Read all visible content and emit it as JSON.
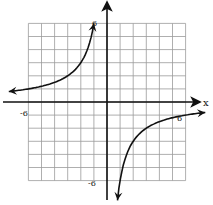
{
  "chart_data": {
    "type": "line",
    "title": "",
    "function": "y = -6/x",
    "xlabel": "x",
    "ylabel": "",
    "xlim": [
      -6,
      6
    ],
    "ylim": [
      -6,
      6
    ],
    "grid": true,
    "grid_step": 1,
    "tick_labels": {
      "x_neg": "-6",
      "x_pos": "6",
      "y_pos": "6",
      "y_neg": "-6"
    },
    "series": [
      {
        "name": "left branch",
        "x": [
          -7.5,
          -6,
          -5,
          -4,
          -3,
          -2,
          -1.5,
          -1.2,
          -1
        ],
        "y": [
          0.8,
          1,
          1.2,
          1.5,
          2,
          3,
          4,
          5,
          6
        ]
      },
      {
        "name": "right branch",
        "x": [
          0.8,
          1,
          1.2,
          1.5,
          2,
          3,
          4,
          5,
          6,
          7.5
        ],
        "y": [
          -7.5,
          -6,
          -5,
          -4,
          -3,
          -2,
          -1.5,
          -1.2,
          -1,
          -0.8
        ]
      }
    ],
    "asymptotes": {
      "vertical": 0,
      "horizontal": 0
    },
    "legend": null
  },
  "labels": {
    "x_axis_name": "x",
    "x_neg": "-6",
    "x_pos": "6",
    "y_pos": "6",
    "y_neg": "-6"
  }
}
